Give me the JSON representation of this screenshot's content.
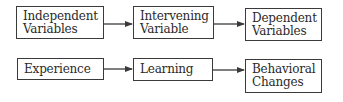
{
  "rows": [
    {
      "name": "abstract",
      "boxes": [
        {
          "lines": [
            "Independent",
            "Variables"
          ]
        },
        {
          "lines": [
            "Intervening",
            "Variable"
          ]
        },
        {
          "lines": [
            "Dependent",
            "Variables"
          ]
        }
      ]
    },
    {
      "name": "example",
      "boxes": [
        {
          "lines": [
            "Experience"
          ]
        },
        {
          "lines": [
            "Learning"
          ]
        },
        {
          "lines": [
            "Behavioral",
            "Changes"
          ]
        }
      ]
    }
  ],
  "colors": {
    "stroke": "#3a3a3a",
    "text": "#2a2a2a",
    "background": "#ffffff"
  }
}
